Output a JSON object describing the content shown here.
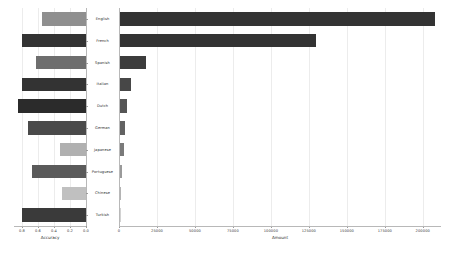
{
  "chart_data": {
    "type": "bar",
    "title": "",
    "orientation": "horizontal",
    "layout": "back-to-back paired bar chart (butterfly / tornado)",
    "categories": [
      "English",
      "French",
      "Spanish",
      "Italian",
      "Dutch",
      "German",
      "Japanese",
      "Portuguese",
      "Chinese",
      "Turkish"
    ],
    "panels": [
      {
        "name": "left",
        "xlabel": "Accuracy",
        "ylabel": "",
        "xlim": [
          0.9,
          0.0
        ],
        "axis_reversed": true,
        "tick_labels": [
          "0.8",
          "0.6",
          "0.4",
          "0.2",
          "0.0"
        ],
        "tick_values": [
          0.8,
          0.6,
          0.4,
          0.2,
          0.0
        ],
        "values": [
          0.55,
          0.8,
          0.62,
          0.8,
          0.85,
          0.72,
          0.33,
          0.68,
          0.3,
          0.8
        ],
        "grid": true
      },
      {
        "name": "right",
        "xlabel": "Amount",
        "ylabel": "",
        "xlim": [
          0,
          212000
        ],
        "tick_labels": [
          "0",
          "25000",
          "50000",
          "75000",
          "100000",
          "125000",
          "150000",
          "175000",
          "200000"
        ],
        "tick_values": [
          0,
          25000,
          50000,
          75000,
          100000,
          125000,
          150000,
          175000,
          200000
        ],
        "values": [
          208000,
          130000,
          17500,
          8000,
          5200,
          4200,
          3000,
          1900,
          1300,
          700
        ],
        "grid": true
      }
    ],
    "series": [
      {
        "name": "Accuracy",
        "panel": "left",
        "values": [
          0.55,
          0.8,
          0.62,
          0.8,
          0.85,
          0.72,
          0.33,
          0.68,
          0.3,
          0.8
        ]
      },
      {
        "name": "Amount",
        "panel": "right",
        "values": [
          208000,
          130000,
          17500,
          8000,
          5200,
          4200,
          3000,
          1900,
          1300,
          700
        ]
      }
    ],
    "bar_colors": [
      "#8f8f8f",
      "#333333",
      "#6e6e6e",
      "#333333",
      "#2b2b2b",
      "#4a4a4a",
      "#b0b0b0",
      "#5a5a5a",
      "#c0c0c0",
      "#3a3a3a"
    ],
    "right_bar_colors": [
      "#333333",
      "#333333",
      "#3c3c3c",
      "#474747",
      "#555555",
      "#626262",
      "#7a7a7a",
      "#9a9a9a",
      "#b4b4b4",
      "#d2d2d2"
    ],
    "legend": [],
    "annotations": []
  },
  "figure": {
    "background": "#ffffff",
    "grid_color": "#ececec",
    "spine_color": "#b8b8b8",
    "text_color": "#2b2b2b"
  }
}
